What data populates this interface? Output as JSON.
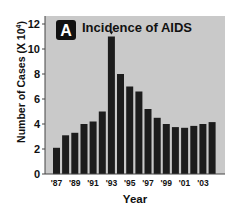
{
  "chart_data": {
    "type": "bar",
    "title": "Incidence of AIDS",
    "panel_label": "A",
    "xlabel": "Year",
    "ylabel": "Number of Cases (X 10",
    "ylabel_exponent": "4",
    "ylabel_close": ")",
    "ylim": [
      0,
      12
    ],
    "yticks": [
      0,
      2,
      4,
      6,
      8,
      10,
      12
    ],
    "grid": false,
    "legend": null,
    "categories": [
      "1987",
      "1988",
      "1989",
      "1990",
      "1991",
      "1992",
      "1993",
      "1994",
      "1995",
      "1996",
      "1997",
      "1998",
      "1999",
      "2000",
      "2001",
      "2002",
      "2003",
      "2004"
    ],
    "xtick_labels": [
      "'87",
      "'89",
      "'91",
      "'93",
      "'95",
      "'97",
      "'99",
      "'01",
      "'03"
    ],
    "xtick_label_indices": [
      0,
      2,
      4,
      6,
      8,
      10,
      12,
      14,
      16
    ],
    "values": [
      2.1,
      3.1,
      3.3,
      4.0,
      4.2,
      5.0,
      11.0,
      8.0,
      7.0,
      6.6,
      5.2,
      4.5,
      4.0,
      3.75,
      3.7,
      3.85,
      4.0,
      4.15
    ],
    "annotations": [
      {
        "category": "1993",
        "type": "marker",
        "text": "*"
      }
    ],
    "colors": {
      "bar": "#1c1c1c",
      "plot_background": "#c9c9c9",
      "badge": "#111111"
    }
  }
}
